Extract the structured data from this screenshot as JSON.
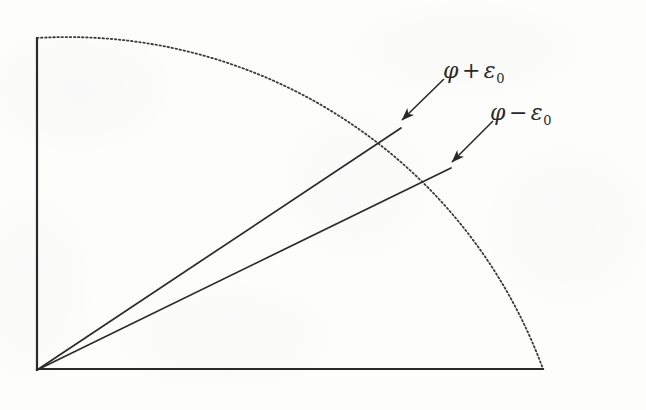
{
  "figure": {
    "type": "geometric-diagram",
    "background_color": "#fdfdfc",
    "ink_color": "#2a2a2a"
  },
  "axes": {
    "vertical_axis_name": "vertical-axis",
    "horizontal_axis_name": "horizontal-axis",
    "origin": {
      "x": 37,
      "y": 370
    },
    "vertical_top": {
      "x": 37,
      "y": 38
    },
    "horizontal_right": {
      "x": 543,
      "y": 369
    },
    "stroke_width": 2.2
  },
  "arc": {
    "name": "dotted-quarter-arc",
    "style": "dotted",
    "radius": 506,
    "start": {
      "x": 37,
      "y": 38
    },
    "end": {
      "x": 543,
      "y": 369
    },
    "stroke_width": 1.8,
    "dash_pattern": "1.5 2.6"
  },
  "rays": [
    {
      "name": "upper-ray",
      "label_key": "phi_plus_eps",
      "from": {
        "x": 37,
        "y": 370
      },
      "to": {
        "x": 401,
        "y": 128
      },
      "stroke_width": 1.7
    },
    {
      "name": "lower-ray",
      "label_key": "phi_minus_eps",
      "from": {
        "x": 37,
        "y": 370
      },
      "to": {
        "x": 451,
        "y": 168
      },
      "stroke_width": 1.7
    }
  ],
  "leaders": [
    {
      "name": "leader-upper",
      "from": {
        "x": 444,
        "y": 79
      },
      "to": {
        "x": 400,
        "y": 122
      },
      "arrowhead": true
    },
    {
      "name": "leader-lower",
      "from": {
        "x": 493,
        "y": 121
      },
      "to": {
        "x": 450,
        "y": 164
      },
      "arrowhead": true
    }
  ],
  "labels": {
    "phi_plus_eps": {
      "variable": "φ",
      "operator": "+",
      "epsilon": "ε",
      "subscript": "0",
      "plain": "φ + ε₀"
    },
    "phi_minus_eps": {
      "variable": "φ",
      "operator": "−",
      "epsilon": "ε",
      "subscript": "0",
      "plain": "φ − ε₀"
    }
  }
}
